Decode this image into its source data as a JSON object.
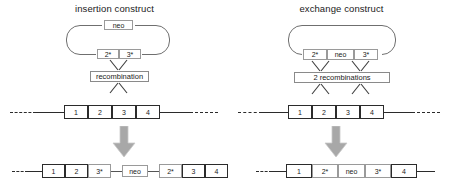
{
  "figure": {
    "type": "diagram",
    "panels": [
      {
        "id": "insertion",
        "title": "insertion construct",
        "construct": {
          "shape": "circular-plasmid",
          "top_elements": [
            {
              "label": "neo"
            }
          ],
          "bottom_elements": [
            {
              "label": "2*"
            },
            {
              "label": "3*"
            }
          ]
        },
        "process": {
          "label": "recombination",
          "crossovers": 1
        },
        "locus": {
          "elements": [
            {
              "label": "1"
            },
            {
              "label": "2"
            },
            {
              "label": "3"
            },
            {
              "label": "4"
            }
          ],
          "left_flank": "dashed",
          "right_flank": "dashed"
        },
        "arrow": "down-arrow-gray",
        "result": {
          "elements": [
            {
              "label": "1",
              "style": "dark"
            },
            {
              "label": "2",
              "style": "dark"
            },
            {
              "label": "3*",
              "style": "light"
            },
            {
              "label": "neo",
              "style": "light"
            },
            {
              "label": "2*",
              "style": "light"
            },
            {
              "label": "3",
              "style": "dark"
            },
            {
              "label": "4",
              "style": "dark"
            }
          ]
        }
      },
      {
        "id": "exchange",
        "title": "exchange construct",
        "construct": {
          "shape": "circular-plasmid",
          "top_elements": [],
          "bottom_elements": [
            {
              "label": "2*"
            },
            {
              "label": "neo"
            },
            {
              "label": "3*"
            }
          ]
        },
        "process": {
          "label": "2 recombinations",
          "crossovers": 2
        },
        "locus": {
          "elements": [
            {
              "label": "1"
            },
            {
              "label": "2"
            },
            {
              "label": "3"
            },
            {
              "label": "4"
            }
          ],
          "left_flank": "dashed",
          "right_flank": "dashed"
        },
        "arrow": "down-arrow-gray",
        "result": {
          "elements": [
            {
              "label": "1",
              "style": "dark"
            },
            {
              "label": "2*",
              "style": "light"
            },
            {
              "label": "neo",
              "style": "light"
            },
            {
              "label": "3*",
              "style": "light"
            },
            {
              "label": "4",
              "style": "dark"
            }
          ]
        }
      }
    ],
    "colors": {
      "line": "#2b2b2b",
      "box_border_light": "#9a9a9a",
      "box_border_dark": "#2b2b2b",
      "arrow_fill": "#a8a8a8",
      "background": "#ffffff"
    }
  }
}
